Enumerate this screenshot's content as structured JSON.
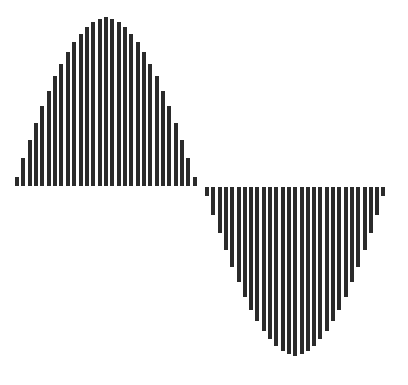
{
  "chart_data": {
    "type": "bar",
    "title": "",
    "xlabel": "",
    "ylabel": "",
    "grid": false,
    "legend": null,
    "bar_color": "#2b2b2b",
    "background": "#ffffff",
    "ylim": [
      -1,
      1
    ],
    "positive_half": {
      "count": 29,
      "x_start": 15,
      "spacing": 6.35,
      "baseline_y": 186,
      "amplitude_px": 172,
      "values": [
        0.054,
        0.162,
        0.267,
        0.368,
        0.464,
        0.554,
        0.637,
        0.712,
        0.779,
        0.837,
        0.885,
        0.924,
        0.953,
        0.972,
        0.98,
        0.972,
        0.953,
        0.924,
        0.885,
        0.837,
        0.779,
        0.712,
        0.637,
        0.554,
        0.464,
        0.368,
        0.267,
        0.162,
        0.054
      ]
    },
    "negative_half": {
      "count": 29,
      "x_start": 205,
      "spacing": 6.3,
      "baseline_y": 187,
      "amplitude_px": 172,
      "values": [
        -0.054,
        -0.162,
        -0.267,
        -0.368,
        -0.464,
        -0.554,
        -0.637,
        -0.712,
        -0.779,
        -0.837,
        -0.885,
        -0.924,
        -0.953,
        -0.972,
        -0.98,
        -0.972,
        -0.953,
        -0.924,
        -0.885,
        -0.837,
        -0.779,
        -0.712,
        -0.637,
        -0.554,
        -0.464,
        -0.368,
        -0.267,
        -0.162,
        -0.054
      ]
    }
  }
}
